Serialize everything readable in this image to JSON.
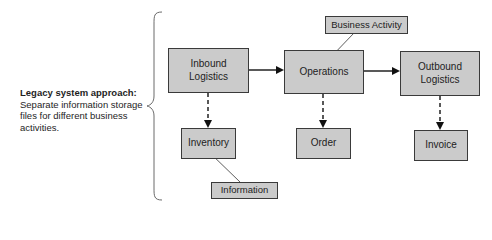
{
  "legend": {
    "title": "Legacy system approach:",
    "description": "Separate information storage files for different business activities."
  },
  "nodes": {
    "inbound": {
      "line1": "Inbound",
      "line2": "Logistics"
    },
    "operations": {
      "label": "Operations"
    },
    "outbound": {
      "line1": "Outbound",
      "line2": "Logistics"
    },
    "inventory": {
      "label": "Inventory"
    },
    "order": {
      "label": "Order"
    },
    "invoice": {
      "label": "Invoice"
    }
  },
  "callouts": {
    "business_activity": {
      "label": "Business Activity"
    },
    "information": {
      "label": "Information"
    }
  },
  "colors": {
    "box_fill": "#cbcbcb",
    "box_border": "#3a3a3a",
    "line": "#222222",
    "brace": "#6a6a6a"
  }
}
